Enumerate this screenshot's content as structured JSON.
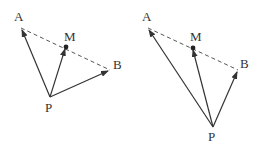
{
  "figures": [
    {
      "name": "left",
      "points": {
        "A": {
          "label": "A",
          "x": 21,
          "y": 28,
          "lx": 14,
          "ly": 21
        },
        "M": {
          "label": "M",
          "x": 66,
          "y": 47,
          "lx": 64,
          "ly": 41
        },
        "B": {
          "label": "B",
          "x": 110,
          "y": 70,
          "lx": 113,
          "ly": 69
        },
        "P": {
          "label": "P",
          "x": 50,
          "y": 97,
          "lx": 45,
          "ly": 112
        }
      }
    },
    {
      "name": "right",
      "points": {
        "A": {
          "label": "A",
          "x": 148,
          "y": 28,
          "lx": 142,
          "ly": 21
        },
        "M": {
          "label": "M",
          "x": 193,
          "y": 48,
          "lx": 190,
          "ly": 41
        },
        "B": {
          "label": "B",
          "x": 238,
          "y": 70,
          "lx": 240,
          "ly": 68
        },
        "P": {
          "label": "P",
          "x": 213,
          "y": 127,
          "lx": 208,
          "ly": 141
        }
      }
    }
  ],
  "colors": {
    "stroke": "#333333",
    "dashed": "#555555"
  }
}
